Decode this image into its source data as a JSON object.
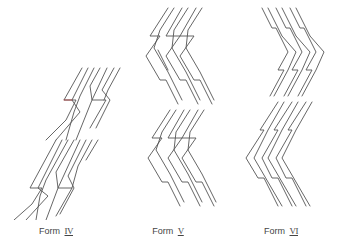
{
  "figure": {
    "forms": [
      {
        "id": "IV",
        "label_prefix": "Form",
        "label_numeral": "IV",
        "label_x": 56
      },
      {
        "id": "V",
        "label_prefix": "Form",
        "label_numeral": "V",
        "label_x": 168
      },
      {
        "id": "VI",
        "label_prefix": "Form",
        "label_numeral": "VI",
        "label_x": 281
      }
    ]
  },
  "colors": {
    "stroke": "#555555",
    "text": "#444444",
    "background": "#ffffff"
  }
}
